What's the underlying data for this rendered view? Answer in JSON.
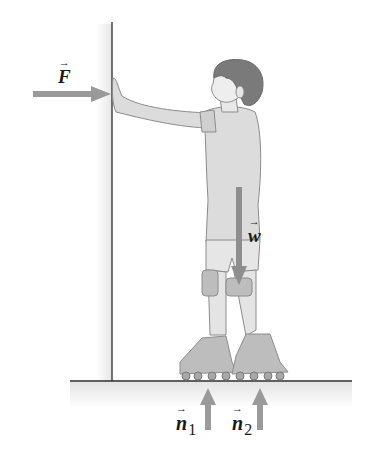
{
  "diagram": {
    "colors": {
      "arrow": "#9a9a9a",
      "line": "#2a2a2a",
      "figure_fill": "#d9d9d9",
      "figure_stroke": "#8c8c8c",
      "hair": "#7a7a7a",
      "wall_shade": "#ececec"
    },
    "labels": {
      "F": {
        "symbol": "F",
        "vector_mark": "→",
        "meaning": "applied force on wall"
      },
      "w": {
        "symbol": "w",
        "vector_mark": "→",
        "meaning": "weight"
      },
      "n1": {
        "symbol": "n",
        "subscript": "1",
        "vector_mark": "→",
        "meaning": "normal force on rear skate"
      },
      "n2": {
        "symbol": "n",
        "subscript": "2",
        "vector_mark": "→",
        "meaning": "normal force on front skate"
      }
    },
    "elements": [
      "wall",
      "floor",
      "child",
      "roller-skates",
      "force-arrow-F",
      "force-arrow-w",
      "force-arrow-n1",
      "force-arrow-n2"
    ]
  }
}
